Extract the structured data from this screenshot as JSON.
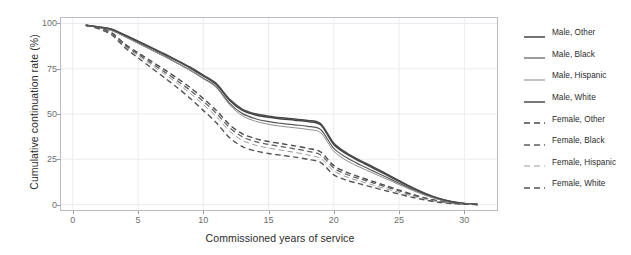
{
  "chart_data": {
    "type": "line",
    "title": "",
    "xlabel": "Commissioned years of service",
    "ylabel": "Cumulative continuation rate (%)",
    "xlim": [
      -0.9,
      32.5
    ],
    "ylim": [
      -3,
      103
    ],
    "xticks": [
      0,
      5,
      10,
      15,
      20,
      25,
      30
    ],
    "xticklabels": [
      "0",
      "5",
      "10",
      "15",
      "20",
      "25",
      "30"
    ],
    "yticks": [
      0,
      25,
      50,
      75,
      100
    ],
    "yticklabels": [
      "0",
      "25",
      "50",
      "75",
      "100"
    ],
    "grid": true,
    "grid_color": "#ececf0",
    "frame_color": "#b9bcc0",
    "legend_position": "right",
    "x": [
      1,
      2,
      3,
      4,
      5,
      6,
      7,
      8,
      9,
      10,
      11,
      12,
      13,
      14,
      15,
      16,
      17,
      18,
      19,
      20,
      21,
      22,
      23,
      24,
      25,
      26,
      27,
      28,
      29,
      30,
      31
    ],
    "series": [
      {
        "name": "Male, Other",
        "style": "solid",
        "color": "#444444",
        "width": 1.5,
        "values": [
          99.0,
          98.0,
          96.6,
          93.4,
          90.0,
          86.5,
          83.0,
          79.3,
          75.4,
          71.0,
          66.3,
          57.6,
          52.0,
          49.5,
          48.2,
          47.3,
          46.6,
          45.8,
          44.0,
          33.2,
          27.8,
          23.8,
          20.2,
          16.5,
          12.8,
          9.2,
          6.0,
          3.4,
          1.6,
          0.6,
          0.1
        ]
      },
      {
        "name": "Male, Black",
        "style": "solid",
        "color": "#5a5a5a",
        "width": 1.2,
        "values": [
          99.0,
          97.8,
          96.2,
          92.8,
          89.2,
          85.6,
          82.0,
          78.2,
          74.2,
          69.8,
          65.0,
          56.0,
          50.2,
          47.4,
          45.8,
          44.8,
          44.0,
          43.2,
          41.3,
          31.0,
          25.8,
          22.0,
          18.6,
          15.2,
          11.8,
          8.5,
          5.5,
          3.1,
          1.5,
          0.5,
          0.1
        ]
      },
      {
        "name": "Male, Hispanic",
        "style": "solid",
        "color": "#8f8f8f",
        "width": 1.0,
        "values": [
          99.0,
          97.6,
          96.0,
          92.6,
          89.0,
          85.4,
          81.8,
          78.0,
          74.0,
          69.5,
          64.6,
          55.2,
          49.0,
          46.0,
          44.3,
          43.2,
          42.4,
          41.5,
          39.6,
          29.4,
          24.2,
          20.6,
          17.4,
          14.2,
          11.0,
          7.9,
          5.1,
          2.9,
          1.4,
          0.5,
          0.1
        ]
      },
      {
        "name": "Male, White",
        "style": "solid",
        "color": "#4a4a4a",
        "width": 1.5,
        "values": [
          99.0,
          98.1,
          96.8,
          93.6,
          90.2,
          86.8,
          83.3,
          79.6,
          75.8,
          71.4,
          66.8,
          58.2,
          52.6,
          50.1,
          48.8,
          47.9,
          47.2,
          46.4,
          44.6,
          33.8,
          28.4,
          24.4,
          20.8,
          17.0,
          13.2,
          9.5,
          6.2,
          3.5,
          1.7,
          0.6,
          0.1
        ]
      },
      {
        "name": "Female, Other",
        "style": "dashed",
        "color": "#4a4a4a",
        "width": 1.4,
        "values": [
          99.0,
          97.6,
          94.8,
          88.6,
          83.8,
          79.2,
          74.6,
          69.8,
          64.6,
          58.6,
          52.0,
          44.2,
          39.0,
          36.4,
          34.8,
          33.6,
          32.4,
          31.0,
          29.0,
          21.5,
          17.8,
          15.2,
          12.8,
          10.4,
          8.0,
          5.7,
          3.6,
          2.0,
          0.9,
          0.3,
          0.0
        ]
      },
      {
        "name": "Female, Black",
        "style": "dashed",
        "color": "#5e5e5e",
        "width": 1.3,
        "values": [
          99.0,
          97.4,
          94.4,
          88.0,
          83.0,
          78.2,
          73.4,
          68.4,
          63.0,
          57.0,
          50.4,
          42.6,
          37.4,
          34.8,
          33.2,
          32.0,
          30.8,
          29.4,
          27.4,
          20.2,
          16.6,
          14.2,
          12.0,
          9.7,
          7.5,
          5.3,
          3.4,
          1.9,
          0.8,
          0.3,
          0.0
        ]
      },
      {
        "name": "Female, Hispanic",
        "style": "dashed",
        "color": "#9a9a9a",
        "width": 1.0,
        "values": [
          99.0,
          97.2,
          94.0,
          87.4,
          82.2,
          77.2,
          72.2,
          67.0,
          61.4,
          55.2,
          48.6,
          40.6,
          35.4,
          32.8,
          31.2,
          30.0,
          28.8,
          27.4,
          25.4,
          18.6,
          15.2,
          12.9,
          10.8,
          8.7,
          6.7,
          4.7,
          3.0,
          1.6,
          0.7,
          0.2,
          0.0
        ]
      },
      {
        "name": "Female, White",
        "style": "dashed",
        "color": "#555555",
        "width": 1.4,
        "values": [
          99.0,
          97.0,
          93.6,
          86.6,
          81.0,
          75.6,
          70.2,
          64.6,
          58.6,
          52.0,
          45.2,
          37.0,
          32.0,
          29.6,
          28.2,
          27.2,
          26.2,
          25.0,
          23.2,
          16.4,
          13.4,
          11.4,
          9.5,
          7.6,
          5.8,
          4.0,
          2.5,
          1.3,
          0.6,
          0.2,
          0.0
        ]
      }
    ]
  },
  "legend": {
    "items": [
      {
        "label": "Male, Other"
      },
      {
        "label": "Male, Black"
      },
      {
        "label": "Male, Hispanic"
      },
      {
        "label": "Male, White"
      },
      {
        "label": "Female, Other"
      },
      {
        "label": "Female, Black"
      },
      {
        "label": "Female, Hispanic"
      },
      {
        "label": "Female, White"
      }
    ]
  }
}
